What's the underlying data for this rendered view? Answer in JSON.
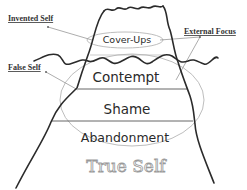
{
  "diagram": {
    "type": "iceberg",
    "callouts": {
      "invented_self": "Invented Self",
      "external_focus": "External Focus",
      "false_self": "False Self"
    },
    "layers": {
      "tip": "Cover-Ups",
      "layer1": "Contempt",
      "layer2": "Shame",
      "layer3": "Abandonment"
    },
    "base_label": "True Self",
    "colors": {
      "outline": "#2b2b2b",
      "ellipse": "#b5b5b5",
      "divider": "#555555",
      "leader": "#8a8a8a",
      "true_self_stroke": "#9a9a9a"
    }
  }
}
